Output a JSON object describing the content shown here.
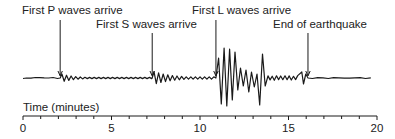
{
  "diagram": {
    "type": "seismogram",
    "colors": {
      "ink": "#1a1a1a",
      "background": "#ffffff"
    },
    "annotations": [
      {
        "id": "p",
        "label": "First P waves arrive",
        "time_min": 2.1
      },
      {
        "id": "s",
        "label": "First S waves arrive",
        "time_min": 7.3
      },
      {
        "id": "l",
        "label": "First L waves arrive",
        "time_min": 10.9
      },
      {
        "id": "end",
        "label": "End of earthquake",
        "time_min": 16.1
      }
    ],
    "axis": {
      "label": "Time (minutes)",
      "range": [
        0,
        20
      ],
      "major_ticks": [
        0,
        5,
        10,
        15,
        20
      ],
      "minor_step": 1,
      "tick_labels": [
        "0",
        "5",
        "10",
        "15",
        "20"
      ]
    },
    "phases": [
      {
        "name": "quiet",
        "start_min": 0,
        "end_min": 2.1,
        "relative_amplitude": 0.02
      },
      {
        "name": "P waves",
        "start_min": 2.1,
        "end_min": 7.3,
        "relative_amplitude": 0.15
      },
      {
        "name": "S waves",
        "start_min": 7.3,
        "end_min": 10.9,
        "relative_amplitude": 0.22
      },
      {
        "name": "L waves",
        "start_min": 10.9,
        "end_min": 13.6,
        "relative_amplitude": 1.0
      },
      {
        "name": "coda",
        "start_min": 13.6,
        "end_min": 16.1,
        "relative_amplitude": 0.15
      },
      {
        "name": "quiet",
        "start_min": 16.1,
        "end_min": 19.7,
        "relative_amplitude": 0.02
      }
    ]
  }
}
